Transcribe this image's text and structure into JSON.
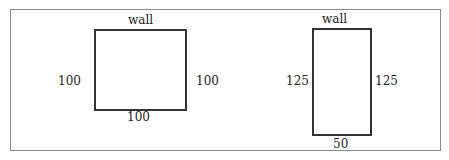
{
  "diagram": {
    "left_room": {
      "top_label": "wall",
      "left_label": "100",
      "right_label": "100",
      "bottom_label": "100",
      "width": 100,
      "height": 100
    },
    "right_room": {
      "top_label": "wall",
      "left_label": "125",
      "right_label": "125",
      "bottom_label": "50",
      "width": 50,
      "height": 125
    }
  }
}
